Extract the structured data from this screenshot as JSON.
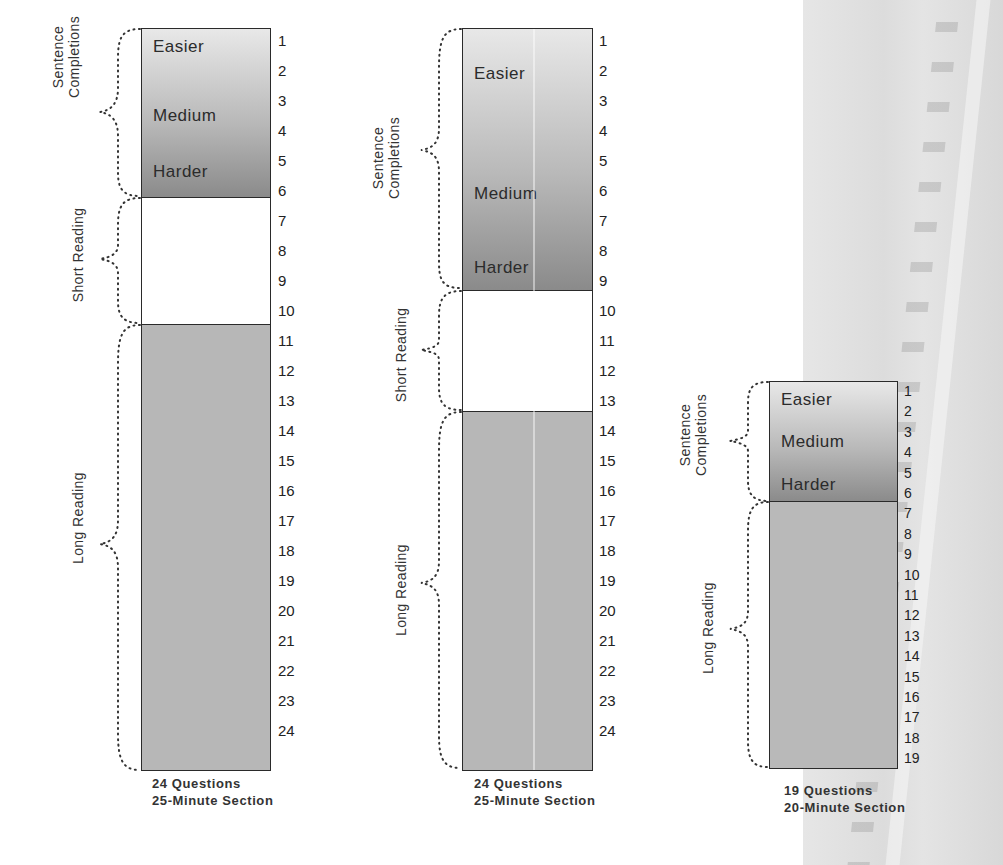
{
  "diagrams": [
    {
      "id": "col1",
      "caption_line1": "24 Questions",
      "caption_line2": "25-Minute Section",
      "sections": [
        {
          "label": "Sentence Completions",
          "label_line1": "Sentence",
          "label_line2": "Completions",
          "questions": "1-5"
        },
        {
          "label": "Short Reading",
          "questions": "6-9"
        },
        {
          "label": "Long Reading",
          "questions": "10-24"
        }
      ],
      "difficulty": [
        "Easier",
        "Medium",
        "Harder"
      ],
      "numbers": [
        "1",
        "2",
        "3",
        "4",
        "5",
        "6",
        "7",
        "8",
        "9",
        "10",
        "11",
        "12",
        "13",
        "14",
        "15",
        "16",
        "17",
        "18",
        "19",
        "20",
        "21",
        "22",
        "23",
        "24"
      ]
    },
    {
      "id": "col2",
      "caption_line1": "24 Questions",
      "caption_line2": "25-Minute Section",
      "sections": [
        {
          "label": "Sentence Completions",
          "label_line1": "Sentence",
          "label_line2": "Completions",
          "questions": "1-8"
        },
        {
          "label": "Short Reading",
          "questions": "9-12"
        },
        {
          "label": "Long Reading",
          "questions": "13-24"
        }
      ],
      "difficulty": [
        "Easier",
        "Medium",
        "Harder"
      ],
      "numbers": [
        "1",
        "2",
        "3",
        "4",
        "5",
        "6",
        "7",
        "8",
        "9",
        "10",
        "11",
        "12",
        "13",
        "14",
        "15",
        "16",
        "17",
        "18",
        "19",
        "20",
        "21",
        "22",
        "23",
        "24"
      ]
    },
    {
      "id": "col3",
      "caption_line1": "19 Questions",
      "caption_line2": "20-Minute Section",
      "sections": [
        {
          "label": "Sentence Completions",
          "label_line1": "Sentence",
          "label_line2": "Completions",
          "questions": "1-6"
        },
        {
          "label": "Long Reading",
          "questions": "7-19"
        }
      ],
      "difficulty": [
        "Easier",
        "Medium",
        "Harder"
      ],
      "numbers": [
        "1",
        "2",
        "3",
        "4",
        "5",
        "6",
        "7",
        "8",
        "9",
        "10",
        "11",
        "12",
        "13",
        "14",
        "15",
        "16",
        "17",
        "18",
        "19"
      ]
    }
  ],
  "colors": {
    "outline": "#2a2a2a",
    "sentence_gradient_top": "#e8e8e8",
    "sentence_gradient_bottom": "#8a8a8a",
    "short_reading_fill": "#ffffff",
    "long_reading_fill": "#b7b7b7"
  }
}
